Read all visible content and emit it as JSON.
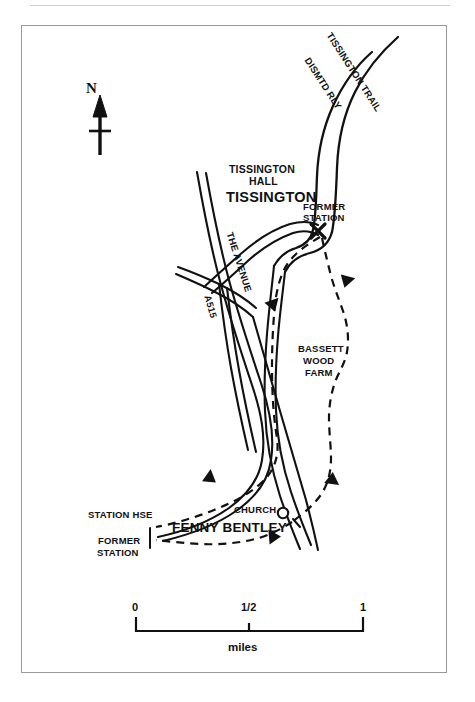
{
  "map": {
    "title": "Tissington and Fenny Bentley walking route map",
    "background_color": "#ffffff",
    "ink_color": "#111111",
    "frame_color": "#9a9a9a",
    "compass": {
      "letter": "N",
      "name": "north-arrow"
    },
    "labels": {
      "tissington_trail": "TISSINGTON TRAIL",
      "dismtd_rly": "DISMTD RLY",
      "tissington_hall_line1": "TISSINGTON",
      "tissington_hall_line2": "HALL",
      "tissington_village": "TISSINGTON",
      "the_avenue": "THE AVENUE",
      "a515": "A515",
      "former_station_north_line1": "FORMER",
      "former_station_north_line2": "STATION",
      "bassett_wood_farm_line1": "BASSETT",
      "bassett_wood_farm_line2": "WOOD",
      "bassett_wood_farm_line3": "FARM",
      "station_hse": "STATION HSE",
      "former_station_south_line1": "FORMER",
      "former_station_south_line2": "STATION",
      "church": "CHURCH",
      "fenny_bentley": "FENNY BENTLEY"
    },
    "scale_bar": {
      "start": "0",
      "middle": "1/2",
      "end": "1",
      "unit": "miles"
    },
    "legend_symbols": {
      "route": "dashed-line-walking-route",
      "road": "double-line-road",
      "railway": "double-line-dismantled-railway",
      "church_marker": "circle-church-symbol",
      "station_marker": "x-cross-former-station"
    }
  }
}
